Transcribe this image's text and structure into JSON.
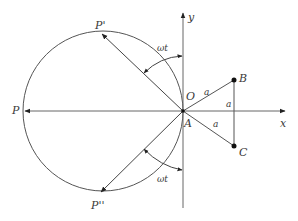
{
  "diagram": {
    "colors": {
      "stroke": "#555555",
      "text": "#3a3a3a",
      "background": "#ffffff"
    },
    "axes": {
      "x_label": "x",
      "y_label": "y"
    },
    "points": {
      "P": "P",
      "P_prime": "P'",
      "P_double_prime": "P''",
      "O": "O",
      "A": "A",
      "B": "B",
      "C": "C"
    },
    "segment_labels": {
      "OB": "a",
      "AC": "a",
      "BC": "a"
    },
    "angle_labels": {
      "upper": "ωt",
      "lower": "ωt"
    }
  }
}
